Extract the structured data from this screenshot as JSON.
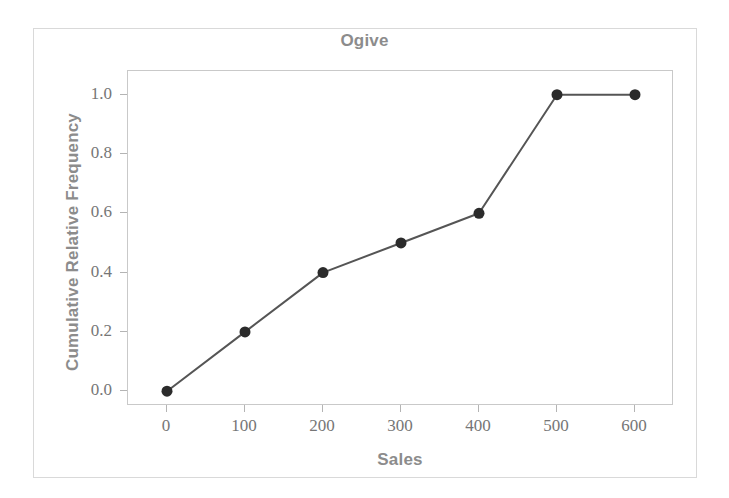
{
  "chart_data": {
    "type": "line",
    "title": "Ogive",
    "xlabel": "Sales",
    "ylabel": "Cumulative Relative Frequency",
    "x": [
      0,
      100,
      200,
      300,
      400,
      500,
      600
    ],
    "values": [
      0.0,
      0.2,
      0.4,
      0.5,
      0.6,
      1.0,
      1.0
    ],
    "series": [
      {
        "name": "Cumulative Relative Frequency",
        "values": [
          0.0,
          0.2,
          0.4,
          0.5,
          0.6,
          1.0,
          1.0
        ]
      }
    ],
    "xlim": [
      -50,
      650
    ],
    "ylim": [
      -0.05,
      1.08
    ],
    "xticks": [
      0,
      100,
      200,
      300,
      400,
      500,
      600
    ],
    "xtick_labels": [
      "0",
      "100",
      "200",
      "300",
      "400",
      "500",
      "600"
    ],
    "yticks": [
      0.0,
      0.2,
      0.4,
      0.6,
      0.8,
      1.0
    ],
    "ytick_labels": [
      "0.0",
      "0.2",
      "0.4",
      "0.6",
      "0.8",
      "1.0"
    ],
    "grid": false,
    "legend": "none",
    "marker": "filled-circle",
    "colors": {
      "line": "#555555",
      "marker": "#2b2b2b",
      "title_text": "#8c8c8c",
      "axis_label_text": "#8c8c8c",
      "tick_label_text": "#767676",
      "plot_border": "#c9c9c9",
      "figure_border": "#d9d9d9",
      "background": "#ffffff"
    }
  }
}
